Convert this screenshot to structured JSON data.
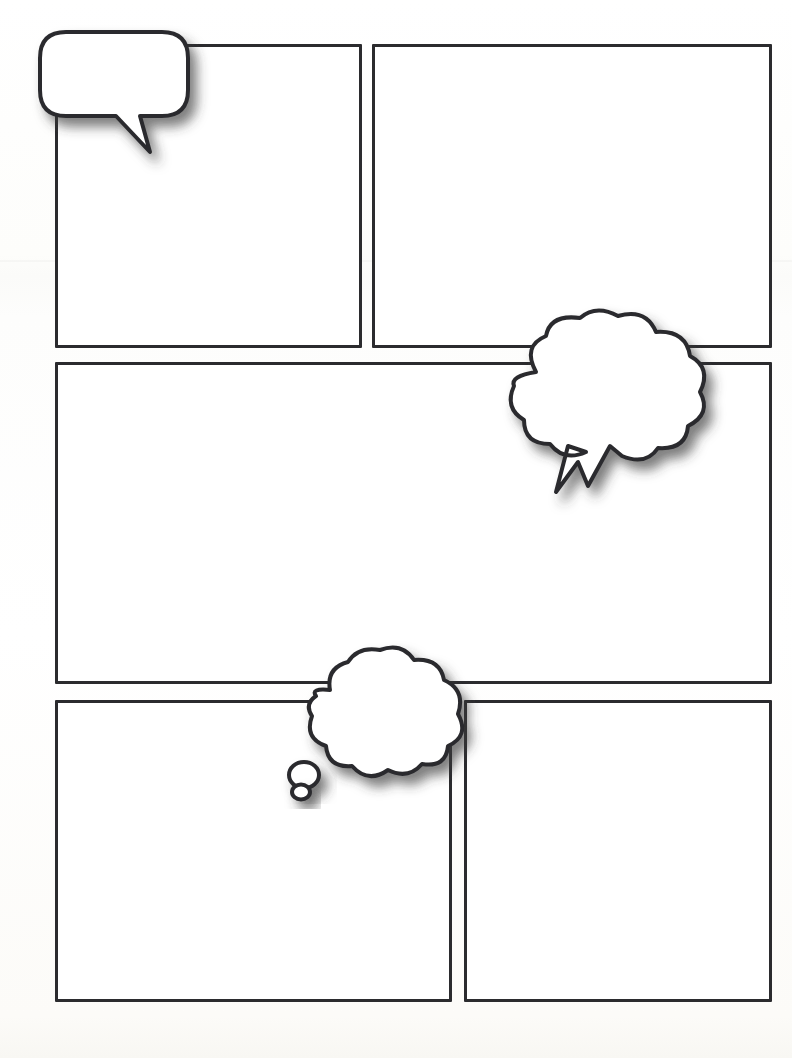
{
  "page": {
    "kind": "comic-page-template",
    "width": 792,
    "height": 1058,
    "background_color": "#fdfdfc",
    "panel_border_color": "#2b2b2e",
    "panel_fill_color": "#ffffff",
    "bubble_fill_color": "#ffffff",
    "bubble_outline_color": "#2b2b2e",
    "shadow_color": "#555555"
  },
  "panels": [
    {
      "name": "panel-1",
      "row": 1,
      "column": 1,
      "x": 55,
      "y": 44,
      "width": 307,
      "height": 304,
      "label": ""
    },
    {
      "name": "panel-2",
      "row": 1,
      "column": 2,
      "x": 372,
      "y": 44,
      "width": 400,
      "height": 304,
      "label": ""
    },
    {
      "name": "panel-3",
      "row": 2,
      "column": 1,
      "x": 55,
      "y": 362,
      "width": 717,
      "height": 322,
      "label": ""
    },
    {
      "name": "panel-4",
      "row": 3,
      "column": 1,
      "x": 55,
      "y": 700,
      "width": 397,
      "height": 302,
      "label": ""
    },
    {
      "name": "panel-5",
      "row": 3,
      "column": 2,
      "x": 464,
      "y": 700,
      "width": 308,
      "height": 302,
      "label": ""
    }
  ],
  "bubbles": [
    {
      "name": "speech-bubble",
      "type": "speech",
      "shape": "rounded-rectangle-with-tail",
      "tail_direction": "down-right",
      "x": 40,
      "y": 30,
      "width": 155,
      "height": 125,
      "text": ""
    },
    {
      "name": "shout-bubble",
      "type": "shout",
      "shape": "cloud-with-lightning-tail",
      "tail_direction": "down-left",
      "x": 504,
      "y": 310,
      "width": 205,
      "height": 185,
      "text": ""
    },
    {
      "name": "thought-bubble",
      "type": "thought",
      "shape": "cloud-with-trailing-dots",
      "tail_direction": "down-left",
      "trailing_dots": 2,
      "x": 288,
      "y": 646,
      "width": 178,
      "height": 155,
      "text": ""
    }
  ]
}
